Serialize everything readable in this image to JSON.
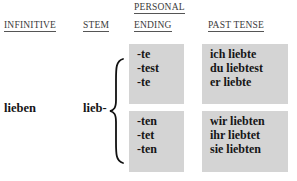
{
  "headers": {
    "infinitive": "INFINITIVE",
    "stem": "STEM",
    "personal_ending_line1": "PERSONAL",
    "personal_ending_line2": "ENDING",
    "past_tense": "PAST TENSE"
  },
  "verb": {
    "infinitive": "lieben",
    "stem": "lieb-"
  },
  "singular": {
    "endings": [
      "-te",
      "-test",
      "-te"
    ],
    "forms": [
      "ich liebte",
      "du liebtest",
      "er liebte"
    ]
  },
  "plural": {
    "endings": [
      "-ten",
      "-tet",
      "-ten"
    ],
    "forms": [
      "wir liebten",
      "ihr liebtet",
      "sie liebten"
    ]
  },
  "colors": {
    "box_fill": "#d4d4d4",
    "text": "#161616",
    "header_text": "#3a3a3a"
  },
  "icons": {
    "brace": "curly-brace-left"
  }
}
